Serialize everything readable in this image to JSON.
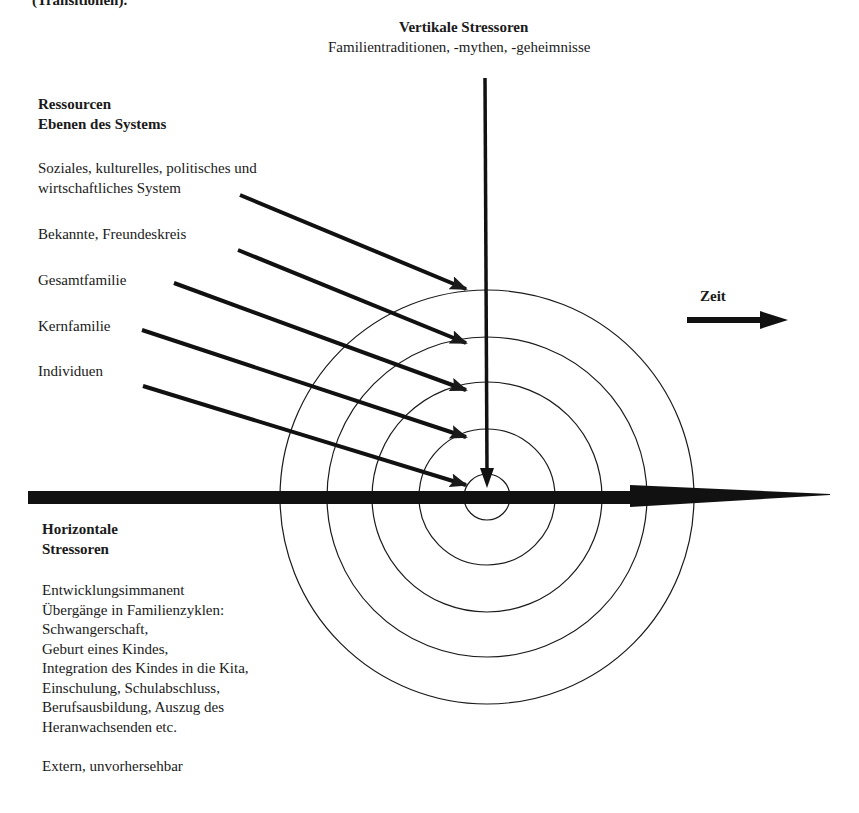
{
  "header": {
    "clipped_caption": "(Transitionen)."
  },
  "vertical_stressors": {
    "title": "Vertikale Stressoren",
    "subtitle": "Familientraditionen, -mythen, -geheimnisse"
  },
  "resources": {
    "title_line1": "Ressourcen",
    "title_line2": "Ebenen des Systems",
    "levels": [
      {
        "label_line1": "Soziales, kulturelles, politisches und",
        "label_line2": "wirtschaftliches System"
      },
      {
        "label_line1": "Bekannte, Freundeskreis",
        "label_line2": ""
      },
      {
        "label_line1": "Gesamtfamilie",
        "label_line2": ""
      },
      {
        "label_line1": "Kernfamilie",
        "label_line2": ""
      },
      {
        "label_line1": "Individuen",
        "label_line2": ""
      }
    ]
  },
  "time": {
    "label": "Zeit"
  },
  "horizontal_stressors": {
    "title_line1": "Horizontale",
    "title_line2": "Stressoren",
    "lines": [
      "Entwicklungsimmanent",
      "Übergänge in Familienzyklen:",
      "Schwangerschaft,",
      "Geburt eines Kindes,",
      "Integration des Kindes in die Kita,",
      "Einschulung, Schulabschluss,",
      "Berufsausbildung, Auszug des",
      "Heranwachsenden etc.",
      "",
      "Extern, unvorhersehbar"
    ]
  },
  "diagram": {
    "ring_count": 5,
    "stroke_color": "#1a1a1a"
  }
}
